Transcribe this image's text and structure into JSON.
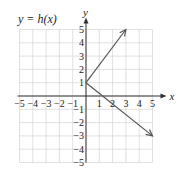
{
  "title": "y = h(x)",
  "chart_data": {
    "type": "line",
    "title": "y = h(x)",
    "xlabel": "x",
    "ylabel": "y",
    "xlim": [
      -5,
      5
    ],
    "ylim": [
      -5,
      5
    ],
    "grid": true,
    "x_ticks": [
      "-5",
      "-4",
      "-3",
      "-2",
      "-1",
      "1",
      "2",
      "3",
      "4",
      "5"
    ],
    "y_ticks": [
      "5",
      "4",
      "3",
      "2",
      "1",
      "-1",
      "-2",
      "-3",
      "-4",
      "-5"
    ],
    "series": [
      {
        "name": "ray up",
        "points": [
          [
            0,
            1
          ],
          [
            3,
            5
          ]
        ],
        "arrow_end": true
      },
      {
        "name": "ray down",
        "points": [
          [
            0,
            1
          ],
          [
            5,
            -3
          ]
        ],
        "arrow_end": true
      }
    ]
  },
  "colors": {
    "grid": "#d9d9d9",
    "axis": "#333333",
    "line": "#555555"
  }
}
